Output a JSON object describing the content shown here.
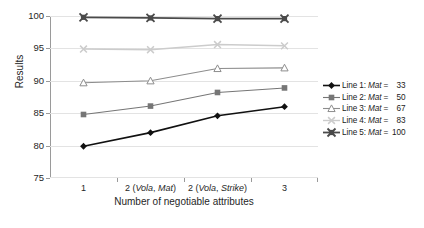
{
  "chart_data": {
    "type": "line",
    "title": "",
    "xlabel": "Number of negotiable attributes",
    "ylabel": "Results",
    "categories": [
      "1",
      "2 (Vola, Mat)",
      "2 (Vola, Strike)",
      "3"
    ],
    "category_parts": [
      {
        "num": "1",
        "paren": ""
      },
      {
        "num": "2",
        "paren": "(Vola, Mat)"
      },
      {
        "num": "2",
        "paren": "(Vola, Strike)"
      },
      {
        "num": "3",
        "paren": ""
      }
    ],
    "ylim": [
      75,
      100
    ],
    "yticks": [
      75,
      80,
      85,
      90,
      95,
      100
    ],
    "grid": true,
    "legend_position": "right",
    "series": [
      {
        "name": "Line 1: Mat = 33",
        "label_prefix": "Line 1: ",
        "label_em": "Mat",
        "label_eq": " = ",
        "value_text": "33",
        "marker": "diamond",
        "color": "#111111",
        "width": 1.6,
        "values": [
          79.9,
          82.0,
          84.6,
          86.0
        ]
      },
      {
        "name": "Line 2: Mat = 50",
        "label_prefix": "Line 2: ",
        "label_em": "Mat",
        "label_eq": " = ",
        "value_text": "50",
        "marker": "square",
        "color": "#767676",
        "width": 1.1,
        "values": [
          84.8,
          86.1,
          88.2,
          88.9
        ]
      },
      {
        "name": "Line 3: Mat = 67",
        "label_prefix": "Line 3: ",
        "label_em": "Mat",
        "label_eq": " = ",
        "value_text": "67",
        "marker": "triangle",
        "color": "#8d8d8d",
        "width": 1.1,
        "values": [
          89.7,
          90.0,
          91.9,
          92.0
        ]
      },
      {
        "name": "Line 4: Mat = 83",
        "label_prefix": "Line 4: ",
        "label_em": "Mat",
        "label_eq": " = ",
        "value_text": "83",
        "marker": "cross",
        "color": "#cccccc",
        "width": 1.4,
        "values": [
          94.9,
          94.8,
          95.6,
          95.4
        ]
      },
      {
        "name": "Line 5: Mat = 100",
        "label_prefix": "Line 5: ",
        "label_em": "Mat",
        "label_eq": " = ",
        "value_text": "100",
        "marker": "squarecross",
        "color": "#4a4a4a",
        "width": 1.8,
        "values": [
          99.8,
          99.7,
          99.6,
          99.6
        ]
      }
    ]
  }
}
